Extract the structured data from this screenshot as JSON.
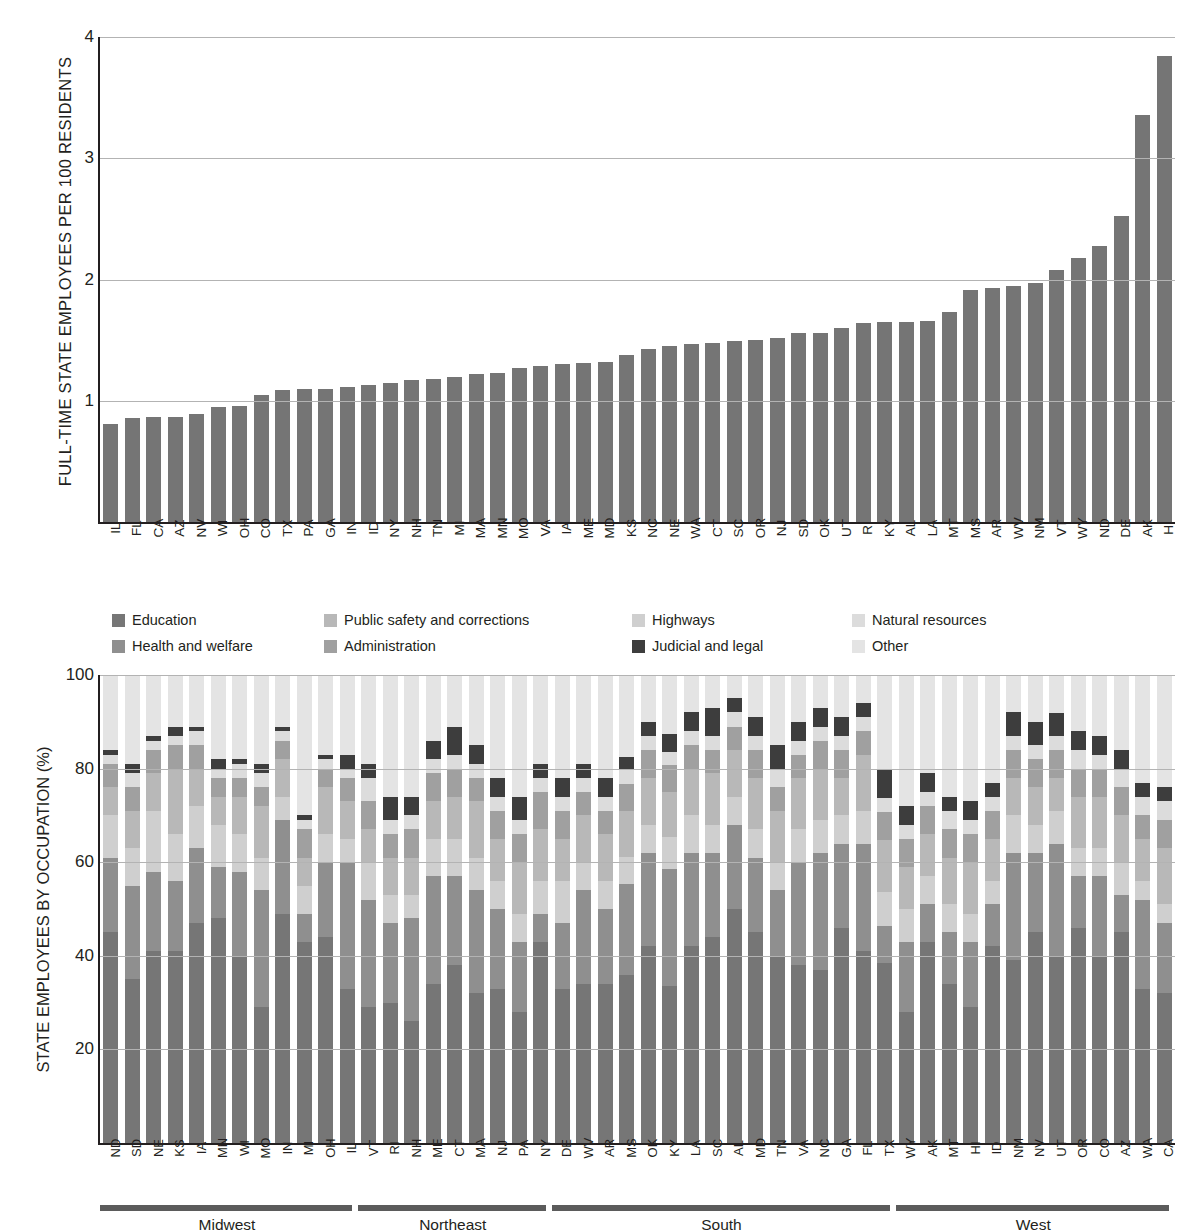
{
  "top": {
    "ylabel": "FULL-TIME STATE EMPLOYEES PER 100 RESIDENTS",
    "yticks": [
      "4",
      "3",
      "2",
      "1"
    ]
  },
  "bottom": {
    "ylabel": "STATE EMPLOYEES BY OCCUPATION (%)",
    "yticks": [
      "100",
      "80",
      "60",
      "40",
      "20"
    ]
  },
  "legend": {
    "items": [
      {
        "label": "Education",
        "color": "#767676"
      },
      {
        "label": "Public safety and corrections",
        "color": "#b8b8b8"
      },
      {
        "label": "Highways",
        "color": "#cfcfcf"
      },
      {
        "label": "Natural resources",
        "color": "#dcdcdc"
      },
      {
        "label": "Health and welfare",
        "color": "#8f8f8f"
      },
      {
        "label": "Administration",
        "color": "#a0a0a0"
      },
      {
        "label": "Judicial and legal",
        "color": "#3d3d3d"
      },
      {
        "label": "Other",
        "color": "#e4e4e4"
      }
    ]
  },
  "regions": [
    {
      "label": "Midwest",
      "count": 12
    },
    {
      "label": "Northeast",
      "count": 9
    },
    {
      "label": "South",
      "count": 16
    },
    {
      "label": "West",
      "count": 13
    }
  ],
  "chart_data": [
    {
      "type": "bar",
      "title": "",
      "xlabel": "",
      "ylabel": "FULL-TIME STATE EMPLOYEES PER 100 RESIDENTS",
      "ylim": [
        0,
        4
      ],
      "yticks": [
        1,
        2,
        3,
        4
      ],
      "grid": true,
      "legend": "none",
      "color": "#757575",
      "categories": [
        "IL",
        "FL",
        "CA",
        "AZ",
        "NV",
        "WI",
        "OH",
        "CO",
        "TX",
        "PA",
        "GA",
        "IN",
        "ID",
        "NY",
        "NH",
        "TN",
        "MI",
        "MA",
        "MN",
        "MO",
        "VA",
        "IA",
        "ME",
        "MD",
        "KS",
        "NC",
        "NE",
        "WA",
        "CT",
        "SC",
        "OR",
        "NJ",
        "SD",
        "OK",
        "UT",
        "RI",
        "KY",
        "AL",
        "LA",
        "MT",
        "MS",
        "AR",
        "WV",
        "NM",
        "VT",
        "WY",
        "ND",
        "DE",
        "AK",
        "HI"
      ],
      "values": [
        0.81,
        0.86,
        0.87,
        0.87,
        0.89,
        0.95,
        0.96,
        1.05,
        1.09,
        1.1,
        1.1,
        1.11,
        1.13,
        1.15,
        1.17,
        1.18,
        1.2,
        1.22,
        1.23,
        1.27,
        1.29,
        1.3,
        1.31,
        1.32,
        1.38,
        1.43,
        1.45,
        1.47,
        1.48,
        1.49,
        1.5,
        1.52,
        1.56,
        1.56,
        1.6,
        1.64,
        1.65,
        1.65,
        1.66,
        1.73,
        1.91,
        1.93,
        1.95,
        1.97,
        2.08,
        2.18,
        2.28,
        2.52,
        3.36,
        3.84
      ]
    },
    {
      "type": "bar",
      "stacked": true,
      "title": "",
      "xlabel": "",
      "ylabel": "STATE EMPLOYEES BY OCCUPATION (%)",
      "ylim": [
        0,
        100
      ],
      "yticks": [
        20,
        40,
        60,
        80,
        100
      ],
      "grid": true,
      "legend": "top",
      "series": [
        {
          "name": "Education",
          "color": "#767676",
          "values": [
            45,
            35,
            41,
            41,
            47,
            48,
            40,
            29,
            49,
            43,
            44,
            33,
            29,
            30,
            26,
            34,
            38,
            32,
            33,
            28,
            43,
            33,
            34,
            34,
            37,
            42,
            35,
            42,
            44,
            50,
            45,
            40,
            38,
            37,
            46,
            41,
            38,
            28,
            43,
            34,
            29,
            42,
            39,
            45,
            40,
            46,
            40,
            45,
            33,
            32
          ]
        },
        {
          "name": "Health and welfare",
          "color": "#8f8f8f",
          "values": [
            16,
            20,
            17,
            15,
            16,
            11,
            18,
            25,
            20,
            6,
            16,
            27,
            23,
            17,
            22,
            23,
            19,
            22,
            17,
            15,
            6,
            14,
            20,
            16,
            20,
            20,
            26,
            20,
            18,
            18,
            16,
            14,
            22,
            25,
            18,
            23,
            8,
            15,
            8,
            11,
            14,
            9,
            23,
            17,
            24,
            11,
            17,
            8,
            19,
            15
          ]
        },
        {
          "name": "Highways",
          "color": "#cfcfcf",
          "values": [
            9,
            8,
            13,
            10,
            9,
            9,
            8,
            7,
            5,
            6,
            6,
            5,
            8,
            6,
            5,
            8,
            8,
            7,
            6,
            6,
            7,
            9,
            6,
            6,
            6,
            6,
            7,
            8,
            6,
            6,
            6,
            6,
            7,
            7,
            6,
            7,
            7,
            7,
            6,
            6,
            6,
            5,
            8,
            6,
            7,
            6,
            6,
            7,
            4,
            4
          ]
        },
        {
          "name": "Public safety and corrections",
          "color": "#b8b8b8",
          "values": [
            6,
            8,
            8,
            14,
            8,
            6,
            8,
            11,
            8,
            6,
            10,
            8,
            7,
            8,
            8,
            8,
            9,
            12,
            9,
            11,
            11,
            9,
            10,
            10,
            10,
            10,
            10,
            10,
            11,
            10,
            11,
            11,
            11,
            11,
            8,
            12,
            11,
            9,
            9,
            10,
            11,
            9,
            8,
            8,
            7,
            11,
            11,
            10,
            9,
            12
          ]
        },
        {
          "name": "Administration",
          "color": "#a0a0a0",
          "values": [
            5,
            5,
            5,
            5,
            5,
            4,
            4,
            4,
            4,
            6,
            4,
            5,
            6,
            5,
            6,
            6,
            6,
            5,
            6,
            6,
            8,
            6,
            5,
            5,
            6,
            6,
            6,
            5,
            5,
            5,
            6,
            5,
            5,
            6,
            6,
            5,
            6,
            6,
            6,
            6,
            6,
            6,
            6,
            6,
            6,
            6,
            6,
            6,
            5,
            6
          ]
        },
        {
          "name": "Natural resources",
          "color": "#dcdcdc",
          "values": [
            2,
            3,
            2,
            2,
            3,
            2,
            3,
            3,
            2,
            2,
            2,
            2,
            5,
            3,
            3,
            3,
            3,
            3,
            3,
            3,
            3,
            3,
            3,
            3,
            3,
            3,
            3,
            3,
            3,
            3,
            3,
            4,
            3,
            3,
            3,
            3,
            3,
            3,
            3,
            4,
            3,
            3,
            3,
            3,
            3,
            4,
            3,
            4,
            4,
            4
          ]
        },
        {
          "name": "Judicial and legal",
          "color": "#3d3d3d",
          "values": [
            1,
            2,
            1,
            2,
            1,
            2,
            1,
            2,
            1,
            1,
            1,
            3,
            3,
            5,
            4,
            4,
            6,
            4,
            4,
            5,
            3,
            4,
            3,
            4,
            3,
            3,
            4,
            4,
            6,
            3,
            4,
            5,
            4,
            4,
            4,
            3,
            6,
            4,
            4,
            3,
            4,
            3,
            5,
            5,
            5,
            4,
            4,
            4,
            3,
            3
          ]
        },
        {
          "name": "Other",
          "color": "#e4e4e4",
          "values": [
            16,
            19,
            13,
            11,
            11,
            18,
            18,
            19,
            11,
            30,
            17,
            17,
            19,
            26,
            26,
            14,
            11,
            15,
            22,
            26,
            19,
            22,
            19,
            22,
            18,
            10,
            13,
            8,
            7,
            5,
            9,
            15,
            10,
            7,
            9,
            6,
            20,
            28,
            21,
            26,
            27,
            23,
            8,
            10,
            8,
            12,
            13,
            16,
            23,
            24
          ]
        }
      ],
      "categories": [
        "ND",
        "SD",
        "NE",
        "KS",
        "IA",
        "MN",
        "WI",
        "MO",
        "IN",
        "MI",
        "OH",
        "IL",
        "VT",
        "RI",
        "NH",
        "ME",
        "CT",
        "MA",
        "NJ",
        "PA",
        "NY",
        "DE",
        "WV",
        "AR",
        "MS",
        "OK",
        "KY",
        "LA",
        "SC",
        "AL",
        "MD",
        "TN",
        "VA",
        "NC",
        "GA",
        "FL",
        "TX",
        "WY",
        "AK",
        "MT",
        "HI",
        "ID",
        "NM",
        "NV",
        "UT",
        "OR",
        "CO",
        "AZ",
        "WA",
        "CA"
      ],
      "annotations": [
        "Midwest",
        "Northeast",
        "South",
        "West"
      ]
    }
  ]
}
